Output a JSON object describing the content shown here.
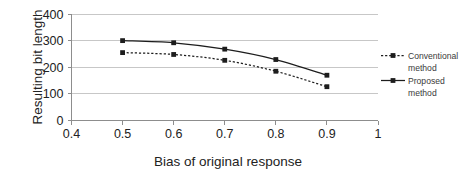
{
  "chart_data": {
    "type": "line",
    "title": "",
    "xlabel": "Bias of original response",
    "ylabel": "Resulting bit length",
    "x": [
      0.5,
      0.6,
      0.7,
      0.8,
      0.9
    ],
    "xlim": [
      0.4,
      1.0
    ],
    "ylim": [
      0,
      400
    ],
    "xticks": [
      "0.4",
      "0.5",
      "0.6",
      "0.7",
      "0.8",
      "0.9",
      "1"
    ],
    "xtick_values": [
      0.4,
      0.5,
      0.6,
      0.7,
      0.8,
      0.9,
      1.0
    ],
    "yticks": [
      "0",
      "100",
      "200",
      "300",
      "400"
    ],
    "ytick_values": [
      0,
      100,
      200,
      300,
      400
    ],
    "grid": "horizontal",
    "legend_position": "right",
    "series": [
      {
        "name": "Conventional method",
        "style": "dashed",
        "marker": "square",
        "values": [
          255,
          248,
          226,
          185,
          127
        ]
      },
      {
        "name": "Proposed method",
        "style": "solid",
        "marker": "square",
        "values": [
          300,
          292,
          268,
          229,
          170
        ]
      }
    ]
  },
  "legend": {
    "items": [
      {
        "line1": "Conventional",
        "line2": "method"
      },
      {
        "line1": "Proposed",
        "line2": "method"
      }
    ]
  },
  "colors": {
    "series": "#1d1d1d",
    "grid": "#b9b9b9",
    "axis": "#8d8d8d",
    "text": "#222222",
    "background": "#ffffff"
  }
}
